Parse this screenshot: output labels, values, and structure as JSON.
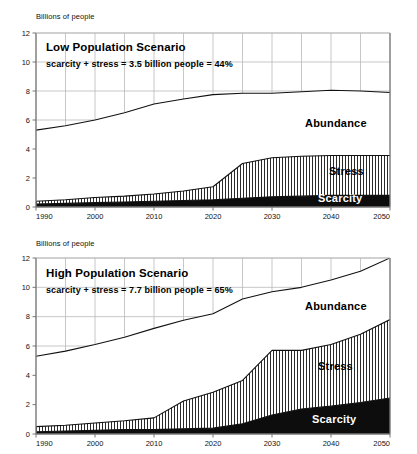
{
  "figure": {
    "axis_title": "Billions of people"
  },
  "panels": [
    {
      "id": "low",
      "axis_title": "Billions of people",
      "scenario_title": "Low Population Scenario",
      "scenario_subtitle": "scarcity + stress = 3.5 billion people = 44%",
      "labels": {
        "abundance": "Abundance",
        "stress": "Stress",
        "scarcity": "Scarcity"
      }
    },
    {
      "id": "high",
      "axis_title": "Billions of people",
      "scenario_title": "High Population Scenario",
      "scenario_subtitle": "scarcity + stress = 7.7 billion people = 65%",
      "labels": {
        "abundance": "Abundance",
        "stress": "Stress",
        "scarcity": "Scarcity"
      }
    }
  ],
  "chart_data": [
    {
      "type": "area",
      "id": "low-population-scenario",
      "title": "Low Population Scenario",
      "annotation": "scarcity + stress = 3.5 billion people = 44%",
      "xlabel": "",
      "ylabel": "Billions of people",
      "xlim": [
        1990,
        2050
      ],
      "ylim": [
        0,
        12
      ],
      "yticks": [
        0,
        2,
        4,
        6,
        8,
        10,
        12
      ],
      "xticks": [
        1990,
        2000,
        2010,
        2020,
        2030,
        2040,
        2050
      ],
      "grid": true,
      "grid_x_step": 5,
      "legend": "inline-labels",
      "stacking": "cumulative",
      "x": [
        1990,
        1995,
        2000,
        2005,
        2010,
        2015,
        2020,
        2025,
        2030,
        2035,
        2040,
        2045,
        2050
      ],
      "series": [
        {
          "name": "Scarcity",
          "fill": "solid-black",
          "values": [
            0.2,
            0.25,
            0.3,
            0.35,
            0.4,
            0.45,
            0.5,
            0.6,
            0.7,
            0.75,
            0.8,
            0.8,
            0.8
          ]
        },
        {
          "name": "Stress",
          "fill": "vertical-hatch",
          "values": [
            0.2,
            0.25,
            0.35,
            0.4,
            0.5,
            0.65,
            0.9,
            2.4,
            2.7,
            2.75,
            2.75,
            2.75,
            2.75
          ]
        },
        {
          "name": "Abundance",
          "fill": "white",
          "values": [
            4.9,
            5.1,
            5.35,
            5.75,
            6.2,
            6.35,
            6.35,
            4.85,
            4.45,
            4.45,
            4.45,
            4.4,
            4.35
          ]
        }
      ],
      "cumulative_lines": [
        {
          "name": "scarcity-top",
          "values": [
            0.2,
            0.25,
            0.3,
            0.35,
            0.4,
            0.45,
            0.5,
            0.6,
            0.7,
            0.75,
            0.8,
            0.8,
            0.8
          ]
        },
        {
          "name": "scarcity+stress-top",
          "values": [
            0.4,
            0.5,
            0.65,
            0.75,
            0.9,
            1.1,
            1.4,
            3.0,
            3.4,
            3.5,
            3.55,
            3.55,
            3.55
          ]
        },
        {
          "name": "total-population",
          "values": [
            5.3,
            5.6,
            6.0,
            6.5,
            7.1,
            7.45,
            7.75,
            7.85,
            7.85,
            7.95,
            8.05,
            8.0,
            7.9
          ]
        }
      ]
    },
    {
      "type": "area",
      "id": "high-population-scenario",
      "title": "High Population Scenario",
      "annotation": "scarcity + stress = 7.7 billion people = 65%",
      "xlabel": "",
      "ylabel": "Billions of people",
      "xlim": [
        1990,
        2050
      ],
      "ylim": [
        0,
        12
      ],
      "yticks": [
        0,
        2,
        4,
        6,
        8,
        10,
        12
      ],
      "xticks": [
        1990,
        2000,
        2010,
        2020,
        2030,
        2040,
        2050
      ],
      "grid": true,
      "grid_x_step": 5,
      "legend": "inline-labels",
      "stacking": "cumulative",
      "x": [
        1990,
        1995,
        2000,
        2005,
        2010,
        2015,
        2020,
        2025,
        2030,
        2035,
        2040,
        2045,
        2050
      ],
      "series": [
        {
          "name": "Scarcity",
          "fill": "solid-black",
          "values": [
            0.15,
            0.2,
            0.25,
            0.3,
            0.3,
            0.35,
            0.4,
            0.7,
            1.3,
            1.7,
            1.9,
            2.15,
            2.45
          ]
        },
        {
          "name": "Stress",
          "fill": "vertical-hatch",
          "values": [
            0.35,
            0.4,
            0.5,
            0.6,
            0.8,
            1.9,
            2.45,
            2.95,
            4.4,
            4.0,
            4.2,
            4.65,
            5.35
          ]
        },
        {
          "name": "Abundance",
          "fill": "white",
          "values": [
            4.8,
            5.05,
            5.35,
            5.7,
            6.1,
            5.5,
            5.35,
            5.55,
            4.0,
            4.3,
            4.4,
            4.3,
            4.2
          ]
        }
      ],
      "cumulative_lines": [
        {
          "name": "scarcity-top",
          "values": [
            0.15,
            0.2,
            0.25,
            0.3,
            0.3,
            0.35,
            0.4,
            0.7,
            1.3,
            1.7,
            1.9,
            2.15,
            2.45
          ]
        },
        {
          "name": "scarcity+stress-top",
          "values": [
            0.5,
            0.6,
            0.75,
            0.9,
            1.1,
            2.25,
            2.85,
            3.65,
            5.7,
            5.7,
            6.1,
            6.8,
            7.8
          ]
        },
        {
          "name": "total-population",
          "values": [
            5.3,
            5.65,
            6.1,
            6.6,
            7.2,
            7.75,
            8.2,
            9.2,
            9.7,
            10.0,
            10.5,
            11.1,
            12.0
          ]
        }
      ]
    }
  ]
}
